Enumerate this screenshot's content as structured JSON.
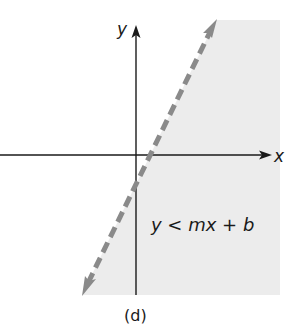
{
  "figure": {
    "caption": "(d)",
    "axes": {
      "x_label": "x",
      "y_label": "y"
    },
    "inequality_label": "y < mx + b",
    "boundary_line": {
      "style": "dashed",
      "color": "#8a8a8a",
      "description": "line y = mx + b with positive slope and negative y-intercept, arrows at both ends"
    },
    "shaded_region": {
      "color": "#ececec",
      "side": "below/right of line"
    },
    "axis_color": "#1a1a1a"
  }
}
